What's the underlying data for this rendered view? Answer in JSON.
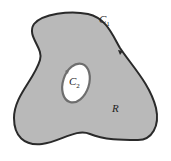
{
  "diagram": {
    "region_label": "R",
    "outer_curve": {
      "letter": "C",
      "subscript": "1"
    },
    "inner_curve": {
      "letter": "C",
      "subscript": "2"
    },
    "colors": {
      "region_fill": "#b9b9b9",
      "outer_stroke": "#2a2a2a",
      "inner_stroke": "#6e6e6e",
      "hole_fill": "#ffffff"
    }
  }
}
